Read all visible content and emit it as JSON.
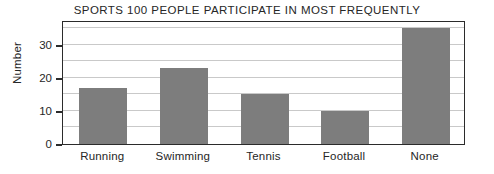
{
  "chart_data": {
    "type": "bar",
    "title": "SPORTS 100 PEOPLE PARTICIPATE IN MOST FREQUENTLY",
    "xlabel": "",
    "ylabel": "Number",
    "categories": [
      "Running",
      "Swimming",
      "Tennis",
      "Football",
      "None"
    ],
    "values": [
      17,
      23,
      15,
      10,
      35
    ],
    "ylim": [
      0,
      37.5
    ],
    "ytick_labels": [
      "0",
      "10",
      "20",
      "30"
    ],
    "ytick_values": [
      0,
      10,
      20,
      30
    ],
    "gridline_values": [
      5,
      10,
      15,
      20,
      25,
      30,
      35
    ],
    "grid": true,
    "legend": "none",
    "bar_color": "#7d7d7d",
    "frame_color": "#2b2b2b",
    "gridline_color": "#c9c9c9",
    "background_color": "#ffffff"
  }
}
